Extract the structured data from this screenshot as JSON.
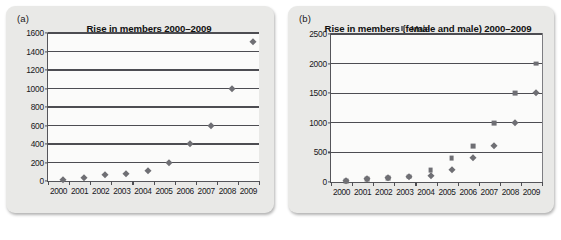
{
  "figure": {
    "panels": [
      {
        "label": "(a)",
        "title": "Rise in members 2000–2009"
      },
      {
        "label": "(b)",
        "title": "Rise in members (female and male) 2000–2009"
      }
    ]
  },
  "chart_data": [
    {
      "type": "scatter",
      "title": "Rise in members 2000–2009",
      "panel_label": "(a)",
      "xlabel": "",
      "ylabel": "",
      "categories": [
        "2000",
        "2001",
        "2002",
        "2003",
        "2004",
        "2005",
        "2006",
        "2007",
        "2008",
        "2009"
      ],
      "values": [
        10,
        30,
        60,
        80,
        110,
        200,
        400,
        600,
        1000,
        1500
      ],
      "ylim": [
        0,
        1600
      ],
      "ytick_labels": [
        "0",
        "200",
        "400",
        "600",
        "800",
        "1000",
        "1200",
        "1400",
        "1600"
      ],
      "yticks": [
        0,
        200,
        400,
        600,
        800,
        1000,
        1200,
        1400,
        1600
      ],
      "grid": true,
      "legend": false,
      "marker": "diamond",
      "marker_color": "#6f6f74"
    },
    {
      "type": "scatter",
      "title": "Rise in members (female and male) 2000–2009",
      "panel_label": "(b)",
      "xlabel": "",
      "ylabel": "",
      "categories": [
        "2000",
        "2001",
        "2002",
        "2003",
        "2004",
        "2005",
        "2006",
        "2007",
        "2008",
        "2009"
      ],
      "series": [
        {
          "name": "Male",
          "marker": "square",
          "color": "#6f6f74",
          "values": [
            20,
            50,
            70,
            90,
            200,
            400,
            600,
            1000,
            1500,
            2000
          ]
        },
        {
          "name": "Female",
          "marker": "diamond",
          "color": "#6f6f74",
          "values": [
            20,
            50,
            70,
            90,
            100,
            200,
            400,
            600,
            1000,
            1500
          ]
        }
      ],
      "ylim": [
        0,
        2500
      ],
      "ytick_labels": [
        "0",
        "500",
        "1000",
        "1500",
        "2000",
        "2500"
      ],
      "yticks": [
        0,
        500,
        1000,
        1500,
        2000,
        2500
      ],
      "grid": true,
      "legend": true,
      "legend_position": "top-right"
    }
  ]
}
